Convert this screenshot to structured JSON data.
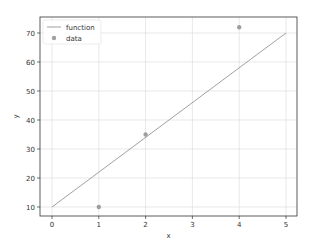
{
  "chart_data": {
    "type": "line+scatter",
    "title": "",
    "xlabel": "x",
    "ylabel": "y",
    "xlim": [
      -0.25,
      5.25
    ],
    "ylim": [
      7,
      74
    ],
    "xticks": [
      0,
      1,
      2,
      3,
      4,
      5
    ],
    "yticks": [
      10,
      20,
      30,
      40,
      50,
      60,
      70
    ],
    "grid": true,
    "legend": {
      "position": "upper left",
      "entries": [
        "function",
        "data"
      ]
    },
    "series": [
      {
        "name": "function",
        "kind": "line",
        "x": [
          0,
          5
        ],
        "y": [
          10,
          70
        ],
        "color": "#888888"
      },
      {
        "name": "data",
        "kind": "scatter",
        "x": [
          1,
          2,
          4
        ],
        "y": [
          10,
          35,
          72
        ],
        "color": "#888888"
      }
    ]
  },
  "legend": {
    "function_label": "function",
    "data_label": "data"
  },
  "axes": {
    "xlabel": "x",
    "ylabel": "y"
  }
}
